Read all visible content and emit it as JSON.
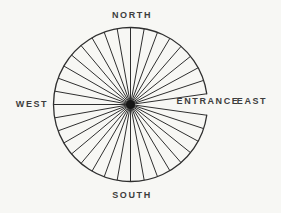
{
  "figure": {
    "background_color": "#f7f7f4",
    "line_color": "#2f2f2f",
    "hub_color": "#161616",
    "text_color": "#3d3d3d",
    "center": {
      "x": 130.5,
      "y": 104.5
    },
    "radius": 77,
    "hub_radius": 4.5,
    "entrance_arc_gap": {
      "start_deg": -8,
      "end_deg": 8
    },
    "spoke_angles_deg": [
      8,
      18.25,
      28.5,
      38.75,
      49,
      59.25,
      69.5,
      79.75,
      90,
      100,
      110,
      120,
      130,
      140,
      150,
      160,
      170,
      180,
      190,
      200,
      210,
      220,
      230,
      240,
      250,
      260,
      270,
      280.25,
      290.5,
      300.75,
      311,
      321.25,
      331.5,
      341.75,
      352
    ],
    "labels": {
      "north": "NORTH",
      "south": "SOUTH",
      "west": "WEST",
      "east": "EAST",
      "entrance": "ENTRANCE"
    }
  }
}
